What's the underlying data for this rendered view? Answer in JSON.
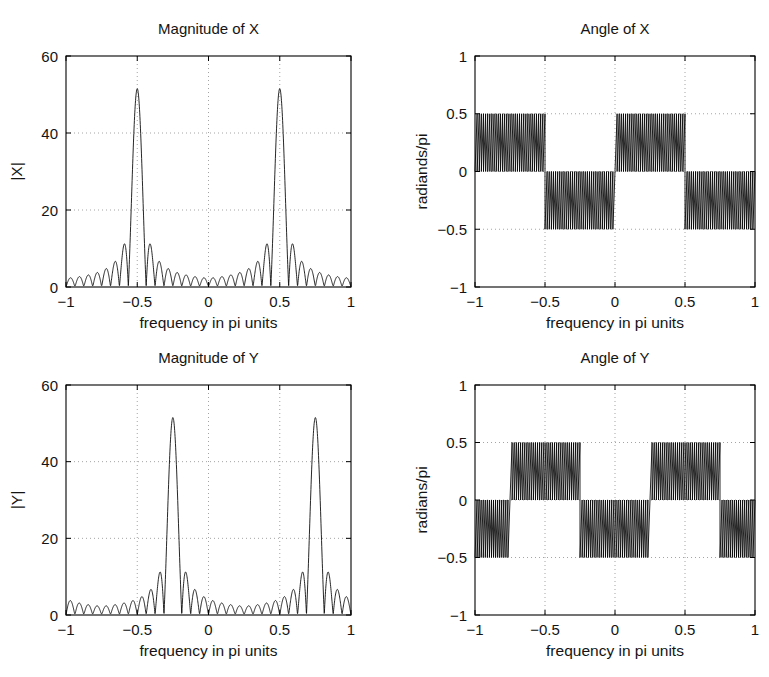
{
  "figure": {
    "background_color": "#ffffff",
    "axis_color": "#000000",
    "grid_color": "#9a9a9a",
    "curve_color": "#000000",
    "width": 769,
    "height": 677
  },
  "chart_data": [
    {
      "id": "magnitude-of-x",
      "type": "line",
      "title": "Magnitude of X",
      "xlabel": "frequency in pi units",
      "ylabel": "|X|",
      "xlim": [
        -1,
        1
      ],
      "ylim": [
        0,
        60
      ],
      "xticks": [
        -1,
        -0.5,
        0,
        0.5,
        1
      ],
      "xticklabels": [
        "−1",
        "−0.5",
        "0",
        "0.5",
        "1"
      ],
      "yticks": [
        0,
        20,
        40,
        60
      ],
      "yticklabels": [
        "0",
        "20",
        "40",
        "60"
      ],
      "grid": true,
      "legend": null,
      "plot_box": {
        "left": 66,
        "top": 56,
        "right": 351,
        "bottom": 287
      },
      "description": "DFT magnitude of a sinusoid: two sinc-like mainlobes at normalized frequency -0.5 and +0.5 with peak value about 51.5 and decaying sidelobe ripples.",
      "model": {
        "kind": "dirichlet-magnitude",
        "peaks": [
          -0.5,
          0.5
        ],
        "peak_value": 51.5,
        "sidelobe_envelope_floor": 1.0,
        "N": 32,
        "ripple_count": 62
      }
    },
    {
      "id": "angle-of-x",
      "type": "line",
      "title": "Angle of X",
      "xlabel": "frequency in pi units",
      "ylabel": "radiands/pi",
      "xlim": [
        -1,
        1
      ],
      "ylim": [
        -1,
        1
      ],
      "xticks": [
        -1,
        -0.5,
        0,
        0.5,
        1
      ],
      "xticklabels": [
        "−1",
        "−0.5",
        "0",
        "0.5",
        "1"
      ],
      "yticks": [
        -1,
        -0.5,
        0,
        0.5,
        1
      ],
      "yticklabels": [
        "−1",
        "−0.5",
        "0",
        "0.5",
        "1"
      ],
      "grid": true,
      "legend": null,
      "plot_box": {
        "left": 475,
        "top": 56,
        "right": 755,
        "bottom": 287
      },
      "description": "Wrapped phase: dense linear-phase sawtooth filling alternating bands of [0,0.5] and [-0.5,0] radians/pi, switching sign at -0.5, 0 and 0.5.",
      "model": {
        "kind": "phase-sawtooth",
        "bands": [
          {
            "x_start": -1,
            "x_end": -0.5,
            "low": 0.0,
            "high": 0.5
          },
          {
            "x_start": -0.5,
            "x_end": 0.0,
            "low": -0.5,
            "high": 0.0
          },
          {
            "x_start": 0.0,
            "x_end": 0.5,
            "low": 0.0,
            "high": 0.5
          },
          {
            "x_start": 0.5,
            "x_end": 1.0,
            "low": -0.5,
            "high": 0.0
          }
        ],
        "teeth_per_band": 33
      }
    },
    {
      "id": "magnitude-of-y",
      "type": "line",
      "title": "Magnitude of Y",
      "xlabel": "frequency in pi units",
      "ylabel": "|Y|",
      "xlim": [
        -1,
        1
      ],
      "ylim": [
        0,
        60
      ],
      "xticks": [
        -1,
        -0.5,
        0,
        0.5,
        1
      ],
      "xticklabels": [
        "−1",
        "−0.5",
        "0",
        "0.5",
        "1"
      ],
      "yticks": [
        0,
        20,
        40,
        60
      ],
      "yticklabels": [
        "0",
        "20",
        "40",
        "60"
      ],
      "grid": true,
      "legend": null,
      "plot_box": {
        "left": 66,
        "top": 385,
        "right": 351,
        "bottom": 615
      },
      "description": "Frequency-shifted version of |X|: mainlobes now at -0.25 and +0.75 with peak value about 51.5.",
      "model": {
        "kind": "dirichlet-magnitude",
        "peaks": [
          -0.25,
          0.75
        ],
        "peak_value": 51.5,
        "sidelobe_envelope_floor": 1.0,
        "N": 32,
        "ripple_count": 62
      }
    },
    {
      "id": "angle-of-y",
      "type": "line",
      "title": "Angle of Y",
      "xlabel": "frequency in pi units",
      "ylabel": "radians/pi",
      "xlim": [
        -1,
        1
      ],
      "ylim": [
        -1,
        1
      ],
      "xticks": [
        -1,
        -0.5,
        0,
        0.5,
        1
      ],
      "xticklabels": [
        "−1",
        "−0.5",
        "0",
        "0.5",
        "1"
      ],
      "yticks": [
        -1,
        -0.5,
        0,
        0.5,
        1
      ],
      "yticklabels": [
        "−1",
        "−0.5",
        "0",
        "0.5",
        "1"
      ],
      "grid": true,
      "legend": null,
      "plot_box": {
        "left": 475,
        "top": 385,
        "right": 755,
        "bottom": 615
      },
      "description": "Wrapped phase of Y: sawtooth bands switching at -0.75, -0.25, 0.25 and 0.75 radians/pi of normalized frequency.",
      "model": {
        "kind": "phase-sawtooth",
        "bands": [
          {
            "x_start": -1.0,
            "x_end": -0.75,
            "low": -0.5,
            "high": 0.0
          },
          {
            "x_start": -0.75,
            "x_end": -0.25,
            "low": 0.0,
            "high": 0.5
          },
          {
            "x_start": -0.25,
            "x_end": 0.25,
            "low": -0.5,
            "high": 0.0
          },
          {
            "x_start": 0.25,
            "x_end": 0.75,
            "low": 0.0,
            "high": 0.5
          },
          {
            "x_start": 0.75,
            "x_end": 1.0,
            "low": -0.5,
            "high": 0.0
          }
        ],
        "teeth_per_band": 33
      }
    }
  ]
}
